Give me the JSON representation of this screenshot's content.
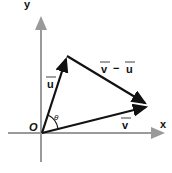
{
  "diagram": {
    "axes": {
      "x_label": "x",
      "y_label": "y",
      "origin_label": "O",
      "axis_color": "#9a9a9a"
    },
    "vectors": [
      {
        "name": "u",
        "label": "u",
        "from": "O",
        "color": "#111111"
      },
      {
        "name": "v",
        "label": "v",
        "from": "O",
        "color": "#111111"
      },
      {
        "name": "v-u",
        "label_v": "v",
        "label_minus": "−",
        "label_u": "u",
        "color": "#111111"
      }
    ],
    "angle": {
      "label": "θ"
    }
  }
}
